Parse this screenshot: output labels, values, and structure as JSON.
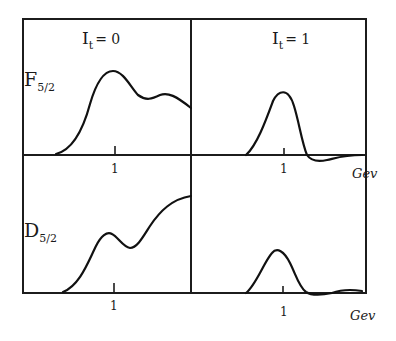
{
  "figure": {
    "columns": [
      {
        "label_main": "I",
        "label_sub": "t",
        "label_rest": "= 0"
      },
      {
        "label_main": "I",
        "label_sub": "t",
        "label_rest": "= 1"
      }
    ],
    "rows": [
      {
        "label_main": "F",
        "label_sub": "5/2"
      },
      {
        "label_main": "D",
        "label_sub": "5/2"
      }
    ],
    "tick_label": "1",
    "x_unit": "Gev",
    "panels": [
      {
        "id": "F52-I0",
        "row": "F5/2",
        "column": "It=0",
        "shape": "broad peak near 1 GeV with secondary shoulder, falling at right edge"
      },
      {
        "id": "F52-I1",
        "row": "F5/2",
        "column": "It=1",
        "shape": "narrow peak near 1 GeV, small negative undershoot after"
      },
      {
        "id": "D52-I0",
        "row": "D5/2",
        "column": "It=0",
        "shape": "small bump just below 1 GeV, then rising toward right edge"
      },
      {
        "id": "D52-I1",
        "row": "D5/2",
        "column": "It=1",
        "shape": "small narrow peak near 1 GeV, slight undershoot then small rise"
      }
    ]
  }
}
